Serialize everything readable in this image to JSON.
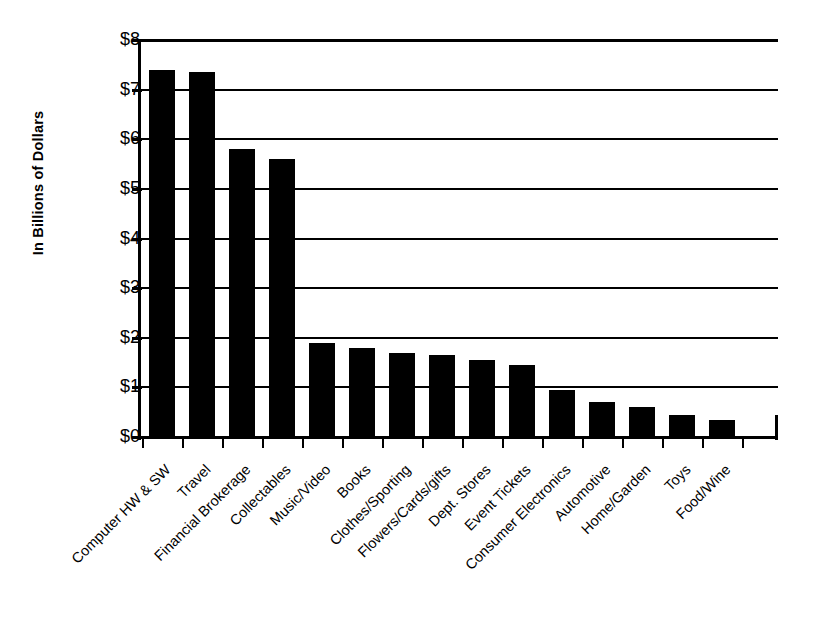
{
  "chart_data": {
    "type": "bar",
    "title": "",
    "subtitle": "",
    "xlabel": "",
    "ylabel": "In Billions of Dollars",
    "ylim": [
      0,
      8
    ],
    "ytick_labels": [
      "$8",
      "$7",
      "$6",
      "$5",
      "$4",
      "$3",
      "$2",
      "$1",
      "$0"
    ],
    "ytick_values": [
      8,
      7,
      6,
      5,
      4,
      3,
      2,
      1,
      0
    ],
    "grid": true,
    "legend": null,
    "bar_color": "#000000",
    "categories": [
      "Computer HW & SW",
      "Travel",
      "Financial Brokerage",
      "Collectables",
      "Music/Video",
      "Books",
      "Clothes/Sporting",
      "Flowers/Cards/gifts",
      "Dept. Stores",
      "Event Tickets",
      "Consumer Electronics",
      "Automotive",
      "Home/Garden",
      "Toys",
      "Food/Wine"
    ],
    "values": [
      7.4,
      7.35,
      5.8,
      5.6,
      1.9,
      1.8,
      1.7,
      1.65,
      1.55,
      1.45,
      0.95,
      0.7,
      0.6,
      0.45,
      0.35
    ]
  }
}
